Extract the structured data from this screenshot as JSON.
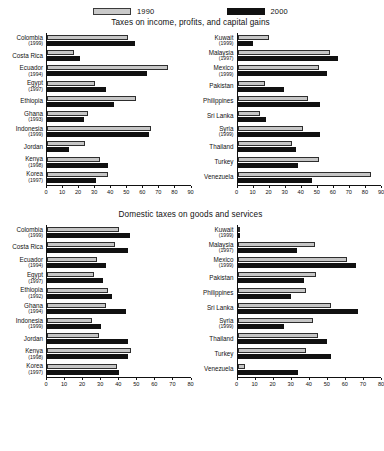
{
  "legend": {
    "entries": [
      {
        "label": "1990",
        "color": "#c6c6c6",
        "key": "v1990"
      },
      {
        "label": "2000",
        "color": "#111111",
        "key": "v2000"
      }
    ]
  },
  "panels": [
    {
      "title": "Taxes on income, profits, and capital gains"
    },
    {
      "title": "Domestic taxes on goods and services"
    }
  ],
  "chart_data": [
    {
      "type": "bar",
      "orientation": "horizontal",
      "title": "Taxes on income, profits, and capital gains",
      "subchart": "left",
      "xlabel": "",
      "ylabel": "",
      "xlim": [
        0,
        90
      ],
      "xticks": [
        0,
        10,
        20,
        30,
        40,
        50,
        60,
        70,
        80,
        90
      ],
      "grid": false,
      "legend_position": "top",
      "categories": [
        "Colombia",
        "Costa Rica",
        "Ecuador",
        "Egypt",
        "Ethiopia",
        "Ghana",
        "Indonesia",
        "Jordan",
        "Kenya",
        "Korea"
      ],
      "category_years": [
        "(1999)",
        "",
        "(1994)",
        "(1997)",
        "",
        "(1993)",
        "(1999)",
        "",
        "(1998)",
        "(1997)"
      ],
      "series": [
        {
          "name": "1990",
          "values": [
            51,
            17,
            76,
            30,
            56,
            26,
            65,
            24,
            33,
            38
          ]
        },
        {
          "name": "2000",
          "values": [
            55,
            21,
            63,
            37,
            42,
            23,
            64,
            14,
            38,
            31
          ]
        }
      ]
    },
    {
      "type": "bar",
      "orientation": "horizontal",
      "title": "Taxes on income, profits, and capital gains",
      "subchart": "right",
      "xlabel": "",
      "ylabel": "",
      "xlim": [
        0,
        90
      ],
      "xticks": [
        0,
        10,
        20,
        30,
        40,
        50,
        60,
        70,
        80,
        90
      ],
      "grid": false,
      "legend_position": "top",
      "categories": [
        "Kuwait",
        "Malaysia",
        "Mexico",
        "Pakistan",
        "Philippines",
        "Sri Lanka",
        "Syria",
        "Thailand",
        "Turkey",
        "Venezuela"
      ],
      "category_years": [
        "(1999)",
        "(1997)",
        "(1999)",
        "",
        "",
        "",
        "(1999)",
        "",
        "",
        ""
      ],
      "series": [
        {
          "name": "1990",
          "values": [
            20,
            58,
            51,
            17,
            44,
            14,
            41,
            34,
            51,
            84
          ]
        },
        {
          "name": "2000",
          "values": [
            10,
            63,
            56,
            29,
            52,
            18,
            52,
            37,
            38,
            47
          ]
        }
      ]
    },
    {
      "type": "bar",
      "orientation": "horizontal",
      "title": "Domestic taxes on goods and services",
      "subchart": "left",
      "xlabel": "",
      "ylabel": "",
      "xlim": [
        0,
        80
      ],
      "xticks": [
        0,
        10,
        20,
        30,
        40,
        50,
        60,
        70,
        80
      ],
      "grid": false,
      "legend_position": "top",
      "categories": [
        "Colombia",
        "Costa Rica",
        "Ecuador",
        "Egypt",
        "Ethiopia",
        "Ghana",
        "Indonesia",
        "Jordan",
        "Kenya",
        "Korea"
      ],
      "category_years": [
        "(1999)",
        "",
        "(1994)",
        "(1997)",
        "(1992)",
        "(1994)",
        "(1999)",
        "",
        "(1998)",
        "(1997)"
      ],
      "series": [
        {
          "name": "1990",
          "values": [
            40,
            38,
            28,
            26,
            34,
            33,
            25,
            29,
            47,
            39
          ]
        },
        {
          "name": "2000",
          "values": [
            46,
            45,
            33,
            31,
            36,
            44,
            30,
            45,
            45,
            40
          ]
        }
      ]
    },
    {
      "type": "bar",
      "orientation": "horizontal",
      "title": "Domestic taxes on goods and services",
      "subchart": "right",
      "xlabel": "",
      "ylabel": "",
      "xlim": [
        0,
        80
      ],
      "xticks": [
        0,
        10,
        20,
        30,
        40,
        50,
        60,
        70,
        80
      ],
      "grid": false,
      "legend_position": "top",
      "categories": [
        "Kuwait",
        "Malaysia",
        "Mexico",
        "Pakistan",
        "Philippines",
        "Sri Lanka",
        "Syria",
        "Thailand",
        "Turkey",
        "Venezuela"
      ],
      "category_years": [
        "(1999)",
        "(1997)",
        "(1999)",
        "",
        "",
        "",
        "(1999)",
        "",
        "",
        ""
      ],
      "series": [
        {
          "name": "1990",
          "values": [
            1,
            43,
            61,
            44,
            38,
            52,
            42,
            45,
            38,
            4
          ]
        },
        {
          "name": "2000",
          "values": [
            1,
            33,
            66,
            37,
            30,
            67,
            26,
            50,
            52,
            34
          ]
        }
      ]
    }
  ]
}
